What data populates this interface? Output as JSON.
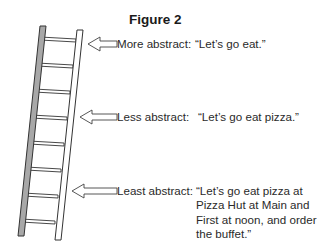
{
  "figure": {
    "title": "Figure 2",
    "levels": [
      {
        "label": "More abstract:",
        "quote": "“Let’s go eat.”"
      },
      {
        "label": "Less abstract:",
        "quote": "“Let’s go eat pizza.”"
      },
      {
        "label": "Least abstract:",
        "quote": "“Let’s go eat pizza at\nPizza Hut at Main and\nFirst at noon, and order\nthe buffet.”"
      }
    ],
    "ladder": {
      "rungs": 8,
      "rail_left_color": "#a8a8a8",
      "rail_right_color": "#ffffff",
      "outline_color": "#333333"
    }
  }
}
